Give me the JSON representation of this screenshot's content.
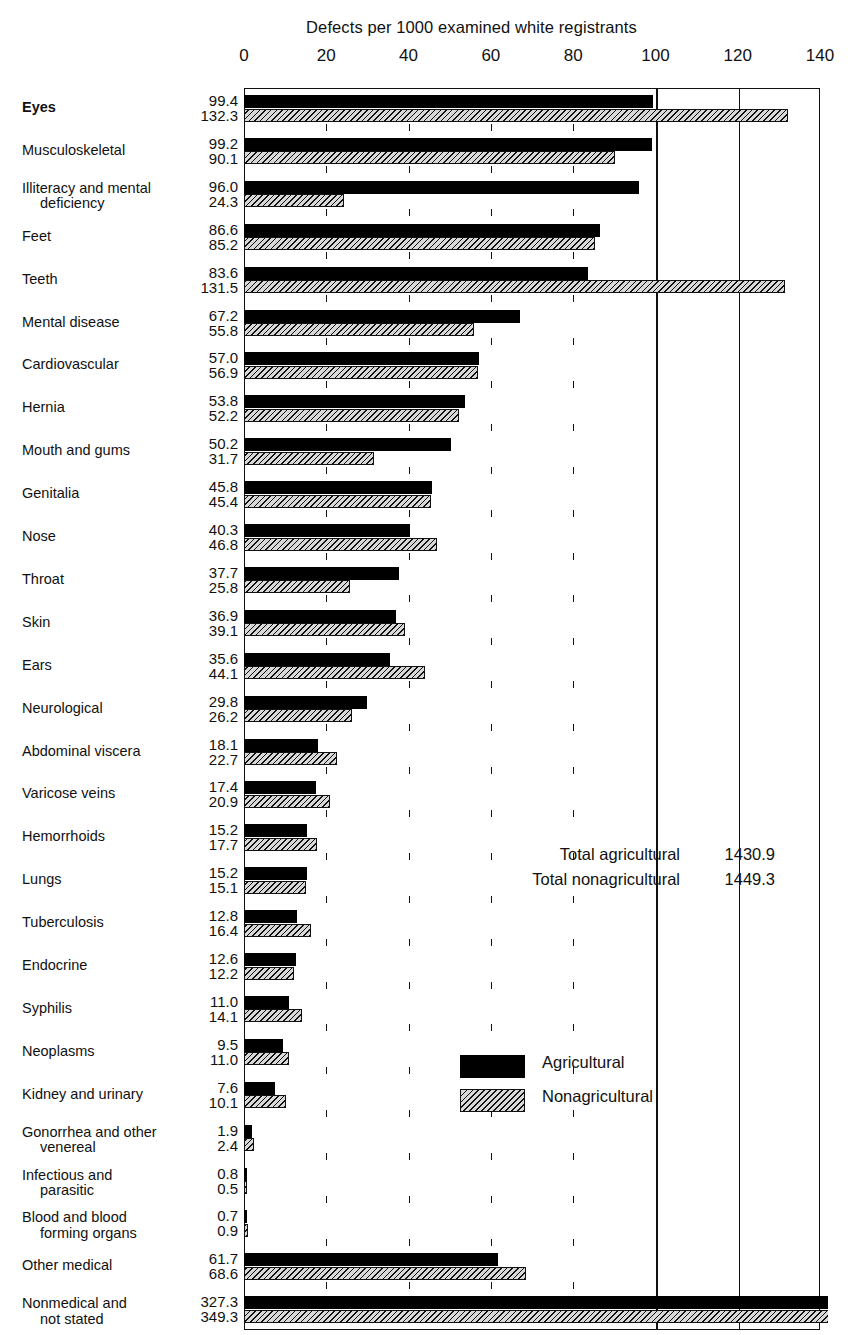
{
  "chart_data": {
    "type": "bar",
    "orientation": "horizontal-grouped",
    "title": "Defects per 1000 examined white registrants",
    "xlabel": "",
    "ylabel": "",
    "xlim": [
      0,
      140
    ],
    "xticks": [
      0,
      20,
      40,
      60,
      80,
      100,
      120,
      140
    ],
    "xtick_labels": [
      "0",
      "20",
      "40",
      "60",
      "80",
      "100",
      "120",
      "140"
    ],
    "grid": "vertical ticks at 20/40/60/80, full lines at 100/120",
    "legend_position": "inside-right-lower",
    "categories": [
      "Eyes",
      "Musculoskeletal",
      "Illiteracy and mental deficiency",
      "Feet",
      "Teeth",
      "Mental disease",
      "Cardiovascular",
      "Hernia",
      "Mouth and gums",
      "Genitalia",
      "Nose",
      "Throat",
      "Skin",
      "Ears",
      "Neurological",
      "Abdominal viscera",
      "Varicose veins",
      "Hemorrhoids",
      "Lungs",
      "Tuberculosis",
      "Endocrine",
      "Syphilis",
      "Neoplasms",
      "Kidney and urinary",
      "Gonorrhea and other venereal",
      "Infectious and parasitic",
      "Blood and blood forming organs",
      "Other medical",
      "Nonmedical and not stated"
    ],
    "series": [
      {
        "name": "Agricultural",
        "values": [
          99.4,
          99.2,
          96.0,
          86.6,
          83.6,
          67.2,
          57.0,
          53.8,
          50.2,
          45.8,
          40.3,
          37.7,
          36.9,
          35.6,
          29.8,
          18.1,
          17.4,
          15.2,
          15.2,
          12.8,
          12.6,
          11.0,
          9.5,
          7.6,
          1.9,
          0.8,
          0.7,
          61.7,
          327.3
        ]
      },
      {
        "name": "Nonagricultural",
        "values": [
          132.3,
          90.1,
          24.3,
          85.2,
          131.5,
          55.8,
          56.9,
          52.2,
          31.7,
          45.4,
          46.8,
          25.8,
          39.1,
          44.1,
          26.2,
          22.7,
          20.9,
          17.7,
          15.1,
          16.4,
          12.2,
          14.1,
          11.0,
          10.1,
          2.4,
          0.5,
          0.9,
          68.6,
          349.3
        ]
      }
    ],
    "annotations": {
      "total_agricultural_label": "Total agricultural",
      "total_agricultural_value": "1430.9",
      "total_nonagricultural_label": "Total nonagricultural",
      "total_nonagricultural_value": "1449.3"
    },
    "colors": {
      "agricultural": "#000000",
      "nonagricultural_fill": "#d8d8d8",
      "nonagricultural_hatch": "#111111",
      "axis": "#111111",
      "background": "#ffffff"
    }
  },
  "rows": [
    {
      "label_line1": "Eyes",
      "label_line2": "",
      "agr": "99.4",
      "nonagr": "132.3"
    },
    {
      "label_line1": "Musculoskeletal",
      "label_line2": "",
      "agr": "99.2",
      "nonagr": "90.1"
    },
    {
      "label_line1": "Illiteracy and mental",
      "label_line2": "deficiency",
      "agr": "96.0",
      "nonagr": "24.3"
    },
    {
      "label_line1": "Feet",
      "label_line2": "",
      "agr": "86.6",
      "nonagr": "85.2"
    },
    {
      "label_line1": "Teeth",
      "label_line2": "",
      "agr": "83.6",
      "nonagr": "131.5"
    },
    {
      "label_line1": "Mental disease",
      "label_line2": "",
      "agr": "67.2",
      "nonagr": "55.8"
    },
    {
      "label_line1": "Cardiovascular",
      "label_line2": "",
      "agr": "57.0",
      "nonagr": "56.9"
    },
    {
      "label_line1": "Hernia",
      "label_line2": "",
      "agr": "53.8",
      "nonagr": "52.2"
    },
    {
      "label_line1": "Mouth and gums",
      "label_line2": "",
      "agr": "50.2",
      "nonagr": "31.7"
    },
    {
      "label_line1": "Genitalia",
      "label_line2": "",
      "agr": "45.8",
      "nonagr": "45.4"
    },
    {
      "label_line1": "Nose",
      "label_line2": "",
      "agr": "40.3",
      "nonagr": "46.8"
    },
    {
      "label_line1": "Throat",
      "label_line2": "",
      "agr": "37.7",
      "nonagr": "25.8"
    },
    {
      "label_line1": "Skin",
      "label_line2": "",
      "agr": "36.9",
      "nonagr": "39.1"
    },
    {
      "label_line1": "Ears",
      "label_line2": "",
      "agr": "35.6",
      "nonagr": "44.1"
    },
    {
      "label_line1": "Neurological",
      "label_line2": "",
      "agr": "29.8",
      "nonagr": "26.2"
    },
    {
      "label_line1": "Abdominal viscera",
      "label_line2": "",
      "agr": "18.1",
      "nonagr": "22.7"
    },
    {
      "label_line1": "Varicose veins",
      "label_line2": "",
      "agr": "17.4",
      "nonagr": "20.9"
    },
    {
      "label_line1": "Hemorrhoids",
      "label_line2": "",
      "agr": "15.2",
      "nonagr": "17.7"
    },
    {
      "label_line1": "Lungs",
      "label_line2": "",
      "agr": "15.2",
      "nonagr": "15.1"
    },
    {
      "label_line1": "Tuberculosis",
      "label_line2": "",
      "agr": "12.8",
      "nonagr": "16.4"
    },
    {
      "label_line1": "Endocrine",
      "label_line2": "",
      "agr": "12.6",
      "nonagr": "12.2"
    },
    {
      "label_line1": "Syphilis",
      "label_line2": "",
      "agr": "11.0",
      "nonagr": "14.1"
    },
    {
      "label_line1": "Neoplasms",
      "label_line2": "",
      "agr": "9.5",
      "nonagr": "11.0"
    },
    {
      "label_line1": "Kidney and urinary",
      "label_line2": "",
      "agr": "7.6",
      "nonagr": "10.1"
    },
    {
      "label_line1": "Gonorrhea and other",
      "label_line2": "venereal",
      "agr": "1.9",
      "nonagr": "2.4"
    },
    {
      "label_line1": "Infectious and",
      "label_line2": "parasitic",
      "agr": "0.8",
      "nonagr": "0.5"
    },
    {
      "label_line1": "Blood and blood",
      "label_line2": "forming organs",
      "agr": "0.7",
      "nonagr": "0.9"
    },
    {
      "label_line1": "Other medical",
      "label_line2": "",
      "agr": "61.7",
      "nonagr": "68.6"
    },
    {
      "label_line1": "Nonmedical  and",
      "label_line2": "not stated",
      "agr": "327.3",
      "nonagr": "349.3"
    }
  ],
  "legend": {
    "agricultural": "Agricultural",
    "nonagricultural": "Nonagricultural"
  }
}
